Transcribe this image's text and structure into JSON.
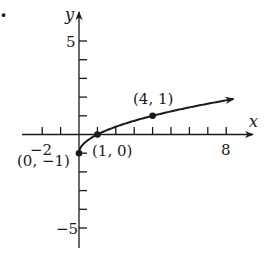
{
  "figure": {
    "bullet": "."
  },
  "chart_data": {
    "type": "line",
    "title": "",
    "function": "y = sqrt(x) - 1",
    "xlabel": "x",
    "ylabel": "y",
    "xlim": [
      -2.5,
      9.5
    ],
    "ylim": [
      -6,
      6.5
    ],
    "grid": false,
    "legend": null,
    "x_ticks": [
      -2,
      -1,
      1,
      2,
      3,
      4,
      5,
      6,
      7,
      8
    ],
    "y_ticks": [
      -5,
      -4,
      -3,
      -2,
      -1,
      1,
      2,
      3,
      4,
      5
    ],
    "x_tick_labels": [
      {
        "value": -2,
        "label": "−2"
      },
      {
        "value": 8,
        "label": "8"
      }
    ],
    "y_tick_labels": [
      {
        "value": 5,
        "label": "5"
      },
      {
        "value": -5,
        "label": "−5"
      }
    ],
    "series": [
      {
        "name": "y = √x − 1",
        "x": [
          0,
          0.25,
          0.5,
          1,
          1.5,
          2,
          3,
          4,
          5,
          6,
          7,
          8,
          8.4
        ],
        "y": [
          -1,
          -0.5,
          -0.293,
          0,
          0.225,
          0.414,
          0.732,
          1,
          1.236,
          1.449,
          1.646,
          1.828,
          1.898
        ],
        "start_closed": true,
        "end_arrow": true
      }
    ],
    "annotations": [
      {
        "x": 0,
        "y": -1,
        "label": "(0, −1)"
      },
      {
        "x": 1,
        "y": 0,
        "label": "(1, 0)"
      },
      {
        "x": 4,
        "y": 1,
        "label": "(4, 1)"
      }
    ]
  }
}
